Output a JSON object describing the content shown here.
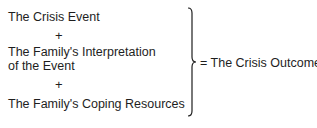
{
  "diagram": {
    "terms": [
      {
        "label": "The Crisis Event"
      },
      {
        "label_line1": "The Family's Interpretation",
        "label_line2": "of the Event"
      },
      {
        "label": "The Family's Coping Resources"
      }
    ],
    "operator": "+",
    "result_prefix": "=",
    "result": "The Crisis Outcome"
  }
}
